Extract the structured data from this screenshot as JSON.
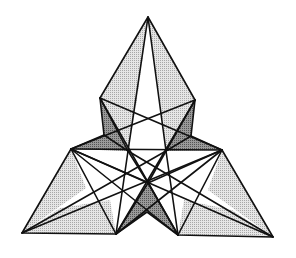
{
  "figure": {
    "colors": {
      "line": "#111111",
      "light_fill": "#cfcfcf",
      "dark_fill": "#8a8a8a",
      "background": "#ffffff"
    },
    "vertices": {
      "T": [
        148,
        17
      ],
      "LS": [
        100,
        98
      ],
      "RS": [
        195,
        100
      ],
      "LN": [
        104,
        135
      ],
      "RN": [
        191,
        136
      ],
      "LM": [
        71,
        149
      ],
      "RM": [
        222,
        150
      ],
      "BL": [
        22,
        233
      ],
      "BR": [
        273,
        237
      ],
      "BIL": [
        116,
        234
      ],
      "BIR": [
        178,
        235
      ],
      "BN": [
        147,
        212
      ],
      "C1": [
        128,
        151
      ],
      "C2": [
        166,
        151
      ],
      "C3": [
        148,
        183
      ]
    }
  }
}
